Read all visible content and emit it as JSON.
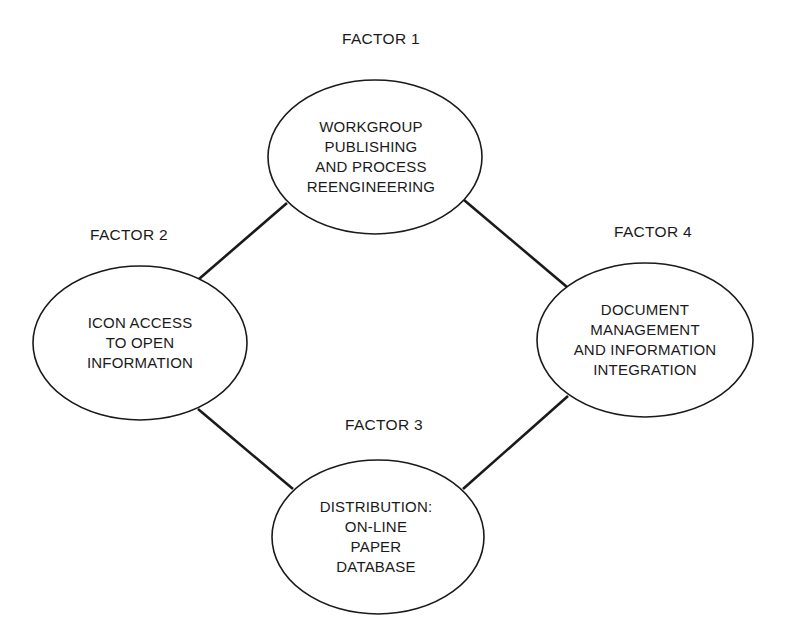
{
  "colors": {
    "background": "#ffffff",
    "stroke": "#1a1a1a",
    "text": "#1a1a1a"
  },
  "factors": [
    {
      "label": "FACTOR 1",
      "lines": [
        "WORKGROUP",
        "PUBLISHING",
        "AND PROCESS",
        "REENGINEERING"
      ]
    },
    {
      "label": "FACTOR 2",
      "lines": [
        "ICON ACCESS",
        "TO OPEN",
        "INFORMATION"
      ]
    },
    {
      "label": "FACTOR 3",
      "lines": [
        "DISTRIBUTION:",
        "ON-LINE",
        "PAPER",
        "DATABASE"
      ]
    },
    {
      "label": "FACTOR 4",
      "lines": [
        "DOCUMENT",
        "MANAGEMENT",
        "AND INFORMATION",
        "INTEGRATION"
      ]
    }
  ],
  "connections": [
    {
      "from": "FACTOR 1",
      "to": "FACTOR 2"
    },
    {
      "from": "FACTOR 1",
      "to": "FACTOR 4"
    },
    {
      "from": "FACTOR 2",
      "to": "FACTOR 3"
    },
    {
      "from": "FACTOR 4",
      "to": "FACTOR 3"
    }
  ]
}
